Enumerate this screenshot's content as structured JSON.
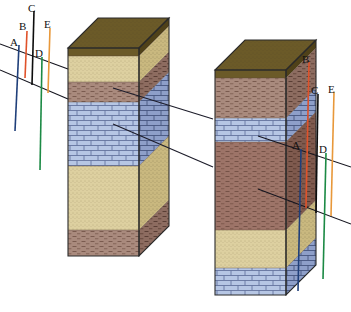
{
  "figure": {
    "type": "geologic-cross-section",
    "title": "",
    "background": "#ffffff",
    "width": 351,
    "height": 312
  },
  "lithology_colors": {
    "soil": "#6b5a28",
    "soil_dark": "#4f4119",
    "sandstone": "#ddd0a0",
    "sandstone_shade": "#c9b87f",
    "shale": "#a98a7d",
    "shale_shade": "#8d6c60",
    "limestone": "#b6c6e4",
    "limestone_shade": "#8e9fc9",
    "outline": "#2a2a2a",
    "correlation_line": "#1d1d2b"
  },
  "well_colors": {
    "A": "#1f3f7a",
    "B": "#e0522a",
    "C": "#0d0d0d",
    "D": "#1c8a45",
    "E": "#e8983a"
  },
  "left_panel": {
    "name": "left-well-set",
    "wells": [
      {
        "id": "A",
        "label": "A",
        "color": "#1f3f7a",
        "x": 19,
        "top": 42,
        "bottom": 130
      },
      {
        "id": "B",
        "label": "B",
        "color": "#e0522a",
        "x": 26,
        "top": 30,
        "bottom": 76
      },
      {
        "id": "C",
        "label": "C",
        "color": "#0d0d0d",
        "x": 33,
        "top": 11,
        "bottom": 84
      },
      {
        "id": "D",
        "label": "D",
        "color": "#1c8a45",
        "x": 41,
        "top": 56,
        "bottom": 169
      },
      {
        "id": "E",
        "label": "E",
        "color": "#e8983a",
        "x": 49,
        "top": 28,
        "bottom": 92
      }
    ],
    "datum_lines": [
      {
        "name": "upper-datum",
        "x1": 5,
        "y1": 46,
        "x2": 65,
        "y2": 68
      },
      {
        "name": "lower-datum",
        "x1": 5,
        "y1": 70,
        "x2": 65,
        "y2": 98
      }
    ],
    "labels": [
      {
        "text": "A",
        "x": 12,
        "y": 46
      },
      {
        "text": "B",
        "x": 21,
        "y": 29
      },
      {
        "text": "C",
        "x": 29,
        "y": 12
      },
      {
        "text": "D",
        "x": 36,
        "y": 56
      },
      {
        "text": "E",
        "x": 46,
        "y": 27
      }
    ]
  },
  "right_panel": {
    "name": "right-well-set",
    "wells": [
      {
        "id": "A",
        "label": "A",
        "color": "#1f3f7a",
        "x": 300,
        "top": 148,
        "bottom": 290
      },
      {
        "id": "B",
        "label": "B",
        "color": "#e0522a",
        "x": 308,
        "top": 62,
        "bottom": 207
      },
      {
        "id": "C",
        "label": "C",
        "color": "#0d0d0d",
        "x": 317,
        "top": 93,
        "bottom": 212
      },
      {
        "id": "D",
        "label": "D",
        "color": "#1c8a45",
        "x": 325,
        "top": 152,
        "bottom": 278
      },
      {
        "id": "E",
        "label": "E",
        "color": "#e8983a",
        "x": 333,
        "top": 92,
        "bottom": 215
      }
    ],
    "datum_lines": [
      {
        "name": "upper-datum",
        "x1": 256,
        "y1": 135,
        "x2": 351,
        "y2": 168
      },
      {
        "name": "lower-datum",
        "x1": 256,
        "y1": 188,
        "x2": 351,
        "y2": 225
      }
    ],
    "labels": [
      {
        "text": "A",
        "x": 294,
        "y": 145
      },
      {
        "text": "B",
        "x": 303,
        "y": 62
      },
      {
        "text": "C",
        "x": 313,
        "y": 93
      },
      {
        "text": "D",
        "x": 321,
        "y": 152
      },
      {
        "text": "E",
        "x": 330,
        "y": 92
      }
    ]
  },
  "left_column": {
    "name": "left-stratigraphic-column",
    "geometry": {
      "left": 68,
      "right": 139,
      "top_front": 48,
      "bottom_front": 256,
      "depth_x": 30,
      "depth_y": -30
    },
    "beds": [
      {
        "name": "soil",
        "rock": "soil",
        "top": 48,
        "bottom": 56,
        "color": "#6b5a28",
        "pattern": "stipple"
      },
      {
        "name": "sandstone-upper",
        "rock": "sandstone",
        "top": 56,
        "bottom": 82,
        "color": "#ddd0a0",
        "pattern": "stipple"
      },
      {
        "name": "shale-upper",
        "rock": "shale",
        "top": 82,
        "bottom": 102,
        "color": "#a98a7d",
        "pattern": "dash"
      },
      {
        "name": "limestone-marker",
        "rock": "limestone",
        "top": 102,
        "bottom": 166,
        "color": "#b6c6e4",
        "pattern": "brick"
      },
      {
        "name": "sandstone-lower",
        "rock": "sandstone",
        "top": 166,
        "bottom": 230,
        "color": "#ddd0a0",
        "pattern": "stipple"
      },
      {
        "name": "shale-lower",
        "rock": "shale",
        "top": 230,
        "bottom": 256,
        "color": "#a98a7d",
        "pattern": "dash"
      }
    ]
  },
  "right_column": {
    "name": "right-stratigraphic-column",
    "geometry": {
      "left": 215,
      "right": 286,
      "top_front": 70,
      "bottom_front": 295,
      "depth_x": 30,
      "depth_y": -30
    },
    "beds": [
      {
        "name": "soil",
        "rock": "soil",
        "top": 70,
        "bottom": 78,
        "color": "#6b5a28",
        "pattern": "stipple"
      },
      {
        "name": "shale-upper",
        "rock": "shale",
        "top": 78,
        "bottom": 118,
        "color": "#a98a7d",
        "pattern": "dash"
      },
      {
        "name": "limestone-marker",
        "rock": "limestone",
        "top": 118,
        "bottom": 142,
        "color": "#b6c6e4",
        "pattern": "brick"
      },
      {
        "name": "shale-middle",
        "rock": "shale",
        "top": 142,
        "bottom": 230,
        "color": "#9d7468",
        "pattern": "dash"
      },
      {
        "name": "sandstone-lower",
        "rock": "sandstone",
        "top": 230,
        "bottom": 268,
        "color": "#ddd0a0",
        "pattern": "stipple"
      },
      {
        "name": "limestone-lower",
        "rock": "limestone",
        "top": 268,
        "bottom": 295,
        "color": "#b6c6e4",
        "pattern": "brick"
      }
    ]
  },
  "correlation_lines": [
    {
      "name": "upper-correlation",
      "from_x": 114,
      "from_y": 90,
      "to_x": 212,
      "to_y": 119,
      "color": "#1d1d2b"
    },
    {
      "name": "lower-correlation",
      "from_x": 114,
      "from_y": 124,
      "to_x": 212,
      "to_y": 165,
      "color": "#1d1d2b"
    },
    {
      "name": "left-stub-upper",
      "x1": 65,
      "y1": 68,
      "x2": 0,
      "y2": 45
    },
    {
      "name": "left-stub-lower",
      "x1": 65,
      "y1": 98,
      "x2": 0,
      "y2": 70
    }
  ]
}
